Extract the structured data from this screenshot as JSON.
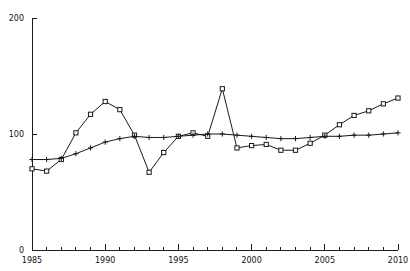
{
  "chart_data": {
    "type": "line",
    "title": "",
    "subtitle": "",
    "xlabel": "",
    "ylabel": "",
    "xlim": [
      1985,
      2010
    ],
    "ylim": [
      0,
      200
    ],
    "grid": false,
    "legend": "none",
    "x_ticks_major": [
      1985,
      1990,
      1995,
      2000,
      2005,
      2010
    ],
    "x_tick_labels": [
      "1985",
      "1990",
      "1995",
      "2000",
      "2005",
      "2010"
    ],
    "x_ticks_minor_step": 1,
    "y_ticks": [
      0,
      100,
      200
    ],
    "y_tick_labels": [
      "0",
      "100",
      "200"
    ],
    "x": [
      1985,
      1986,
      1987,
      1988,
      1989,
      1990,
      1991,
      1992,
      1993,
      1994,
      1995,
      1996,
      1997,
      1998,
      1999,
      2000,
      2001,
      2002,
      2003,
      2004,
      2005,
      2006,
      2007,
      2008,
      2009,
      2010
    ],
    "series": [
      {
        "name": "series-squares",
        "marker": "square",
        "values": [
          70,
          68,
          78,
          101,
          117,
          128,
          121,
          99,
          67,
          84,
          98,
          101,
          98,
          139,
          88,
          90,
          91,
          86,
          86,
          92,
          99,
          108,
          116,
          120,
          126,
          131
        ]
      },
      {
        "name": "series-plus",
        "marker": "plus",
        "values": [
          78,
          78,
          79,
          83,
          88,
          93,
          96,
          98,
          97,
          97,
          98,
          99,
          100,
          100,
          99,
          98,
          97,
          96,
          96,
          97,
          98,
          98,
          99,
          99,
          100,
          101
        ]
      }
    ]
  },
  "axes": {
    "y_axis_name": "y-axis",
    "x_axis_name": "x-axis"
  }
}
